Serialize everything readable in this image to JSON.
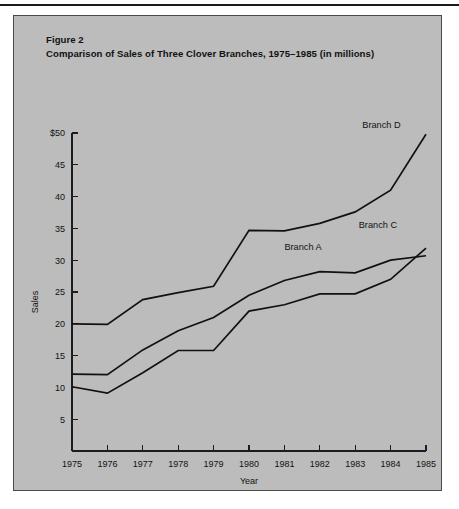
{
  "page": {
    "background_color": "#ffffff",
    "panel_color": "#bcbcbc",
    "ink_color": "#121212"
  },
  "figure": {
    "number_label": "Figure 2",
    "caption": "Comparison of Sales of Three Clover Branches, 1975–1985 (in millions)"
  },
  "chart_data": {
    "type": "line",
    "title": "Comparison of Sales of Three Clover Branches, 1975–1985 (in millions)",
    "subtitle": "Figure 2",
    "xlabel": "Year",
    "ylabel": "Sales",
    "x": [
      1975,
      1976,
      1977,
      1978,
      1979,
      1980,
      1981,
      1982,
      1983,
      1984,
      1985
    ],
    "categories": [
      "1975",
      "1976",
      "1977",
      "1978",
      "1979",
      "1980",
      "1981",
      "1982",
      "1983",
      "1984",
      "1985"
    ],
    "xlim": [
      1975,
      1985
    ],
    "ylim": [
      0,
      50
    ],
    "y_ticks": [
      5,
      10,
      15,
      20,
      25,
      30,
      35,
      40,
      45,
      50
    ],
    "y_tick_labels": [
      "5",
      "10",
      "15",
      "20",
      "25",
      "30",
      "35",
      "40",
      "45",
      "$50"
    ],
    "x_ticks": [
      1975,
      1976,
      1977,
      1978,
      1979,
      1980,
      1981,
      1982,
      1983,
      1984,
      1985
    ],
    "x_tick_labels": [
      "1975",
      "1976",
      "1977",
      "1978",
      "1979",
      "1980",
      "1981",
      "1982",
      "1983",
      "1984",
      "1985"
    ],
    "grid": false,
    "legend": "inline-labels",
    "series": [
      {
        "name": "Branch D",
        "label": "Branch D",
        "color": "#111111",
        "values": [
          20.0,
          19.9,
          23.8,
          24.9,
          25.9,
          34.7,
          34.6,
          35.8,
          37.6,
          41.0,
          49.8
        ],
        "label_x": 1983.2,
        "label_y": 50.8
      },
      {
        "name": "Branch A",
        "label": "Branch A",
        "color": "#111111",
        "values": [
          12.1,
          12.0,
          15.9,
          18.9,
          21.0,
          24.5,
          26.8,
          28.2,
          28.0,
          30.0,
          30.7
        ],
        "label_x": 1981.0,
        "label_y": 31.6
      },
      {
        "name": "Branch C",
        "label": "Branch C",
        "color": "#111111",
        "values": [
          10.1,
          9.1,
          12.3,
          15.8,
          15.8,
          22.0,
          23.0,
          24.7,
          24.7,
          27.0,
          31.9
        ],
        "label_x": 1983.1,
        "label_y": 35.1
      }
    ]
  }
}
